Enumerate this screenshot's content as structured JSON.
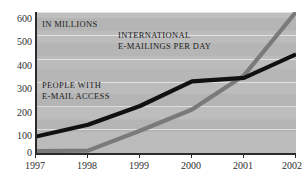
{
  "chart_data": {
    "type": "line",
    "title": "",
    "subtitle": "",
    "unit_note": "IN MILLIONS",
    "xlabel": "",
    "ylabel": "",
    "x": [
      "1997",
      "1998",
      "1999",
      "2000",
      "2001",
      "2002"
    ],
    "xtick_labels": [
      "1997",
      "1998",
      "1999",
      "2000",
      "2001",
      "2002"
    ],
    "ytick_labels": [
      "600",
      "500",
      "400",
      "300",
      "200",
      "100",
      "0"
    ],
    "ytick_values": [
      600,
      500,
      400,
      300,
      200,
      100,
      0
    ],
    "ylim": [
      0,
      600
    ],
    "grid": true,
    "legend": "inline-annotations",
    "background": "#b8b8b8",
    "series": [
      {
        "name": "PEOPLE WITH E-MAIL ACCESS",
        "color": "#111111",
        "values": [
          70,
          120,
          200,
          305,
          320,
          420
        ]
      },
      {
        "name": "INTERNATIONAL E-MAILINGS PER DAY",
        "color": "#7a7a7a",
        "values": [
          8,
          10,
          95,
          185,
          330,
          600
        ]
      }
    ],
    "annotations": [
      {
        "id": "unit-note",
        "text": "IN MILLIONS"
      },
      {
        "id": "series-gray-line1",
        "text": "INTERNATIONAL"
      },
      {
        "id": "series-gray-line2",
        "text": "E-MAILINGS PER DAY"
      },
      {
        "id": "series-black-line1",
        "text": "PEOPLE WITH"
      },
      {
        "id": "series-black-line2",
        "text": "E-MAIL ACCESS"
      }
    ]
  },
  "axis": {
    "y": {
      "t600": "600",
      "t500": "500",
      "t400": "400",
      "t300": "300",
      "t200": "200",
      "t100": "100",
      "t0": "0"
    },
    "x": {
      "t1997": "1997",
      "t1998": "1998",
      "t1999": "1999",
      "t2000": "2000",
      "t2001": "2001",
      "t2002": "2002"
    }
  },
  "labels": {
    "unit": "IN MILLIONS",
    "gray_l1": "INTERNATIONAL",
    "gray_l2": "E-MAILINGS PER DAY",
    "black_l1": "PEOPLE WITH",
    "black_l2": "E-MAIL ACCESS"
  }
}
